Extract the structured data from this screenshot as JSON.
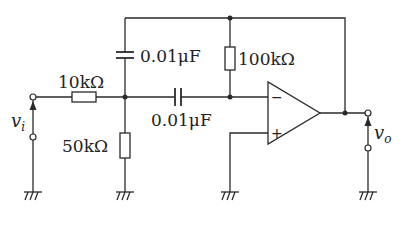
{
  "diagram": {
    "type": "circuit-schematic",
    "input": {
      "label": "v",
      "subscript": "i"
    },
    "output": {
      "label": "v",
      "subscript": "o"
    },
    "components": {
      "r_input": {
        "name": "R1",
        "value": "10kΩ"
      },
      "r_ground": {
        "name": "R2",
        "value": "50kΩ"
      },
      "r_feedback": {
        "name": "R3",
        "value": "100kΩ"
      },
      "c_feedback": {
        "name": "C1",
        "value": "0.01μF"
      },
      "c_series": {
        "name": "C2",
        "value": "0.01μF"
      }
    },
    "opamp": {
      "inverting_label": "−",
      "noninverting_label": "+"
    }
  }
}
